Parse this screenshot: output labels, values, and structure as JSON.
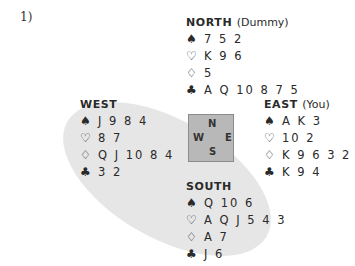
{
  "problem_number": "1)",
  "compass": {
    "n": "N",
    "w": "W",
    "e": "E",
    "s": "S"
  },
  "hands": {
    "north": {
      "name": "NORTH",
      "role": "(Dummy)",
      "spades": "7 5 2",
      "hearts": "K 9 6",
      "diamonds": "5",
      "clubs": "A Q 10 8 7 5"
    },
    "west": {
      "name": "WEST",
      "role": "",
      "spades": "J 9 8 4",
      "hearts": "8 7",
      "diamonds": "Q J 10 8 4",
      "clubs": "3 2"
    },
    "east": {
      "name": "EAST",
      "role": "(You)",
      "spades": "A K 3",
      "hearts": "10 2",
      "diamonds": "K 9 6 3 2",
      "clubs": "K 9 4"
    },
    "south": {
      "name": "SOUTH",
      "role": "",
      "spades": "Q 10 6",
      "hearts": "A Q J 5 4 3",
      "diamonds": "A 7",
      "clubs": "J 6"
    }
  },
  "suits": {
    "spades": "♠",
    "hearts": "♡",
    "diamonds": "♢",
    "clubs": "♣"
  },
  "colors": {
    "highlight_ellipse": "#e6e6e6",
    "compass_box": "#b8b8b8"
  }
}
